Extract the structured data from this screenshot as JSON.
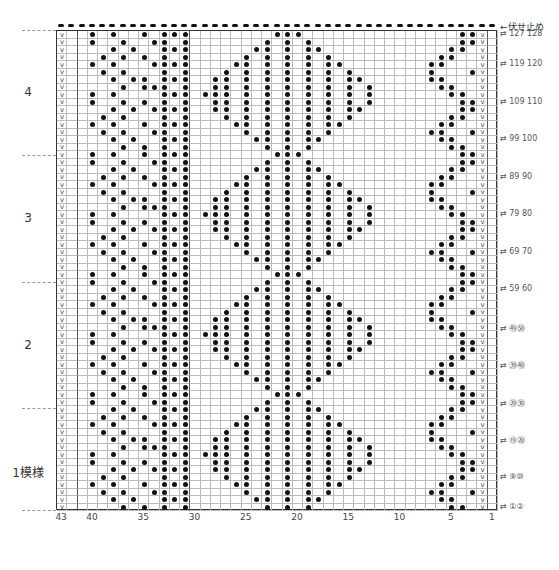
{
  "chart": {
    "columns": 43,
    "rows": 64,
    "grid_color": "#bbbbbb",
    "stitch_symbol": "purl-dot",
    "edge_symbol": "slip-v"
  },
  "top_annotation": "←伏せ止め",
  "repeat_labels": [
    {
      "label": "4",
      "y": 92
    },
    {
      "label": "3",
      "y": 218
    },
    {
      "label": "2",
      "y": 345
    },
    {
      "label": "1模様",
      "y": 470
    }
  ],
  "repeat_dividers": [
    30,
    155,
    282,
    408,
    510
  ],
  "x_ticks": [
    {
      "label": "43",
      "col": 43
    },
    {
      "label": "40",
      "col": 40
    },
    {
      "label": "35",
      "col": 35
    },
    {
      "label": "30",
      "col": 30
    },
    {
      "label": "25",
      "col": 25
    },
    {
      "label": "20",
      "col": 20
    },
    {
      "label": "15",
      "col": 15
    },
    {
      "label": "10",
      "col": 10
    },
    {
      "label": "5",
      "col": 5
    },
    {
      "label": "1",
      "col": 1
    }
  ],
  "row_labels": [
    {
      "label": "⇄ 127 128",
      "row": 64
    },
    {
      "label": "⇄ 119 120",
      "row": 60
    },
    {
      "label": "⇄ 109 110",
      "row": 55
    },
    {
      "label": "⇄ 99 100",
      "row": 50
    },
    {
      "label": "⇄ 89 90",
      "row": 45
    },
    {
      "label": "⇄ 79 80",
      "row": 40
    },
    {
      "label": "⇄ 69 70",
      "row": 35
    },
    {
      "label": "⇄ 59 60",
      "row": 30
    },
    {
      "label": "⇄ ㊾㊿",
      "row": 25
    },
    {
      "label": "⇄ ㊴㊵",
      "row": 20
    },
    {
      "label": "⇄ ㉙㉚",
      "row": 15
    },
    {
      "label": "⇄ ⑲⑳",
      "row": 10
    },
    {
      "label": "⇄ ⑨⑩",
      "row": 5
    },
    {
      "label": "⇄ ①②",
      "row": 1
    }
  ]
}
